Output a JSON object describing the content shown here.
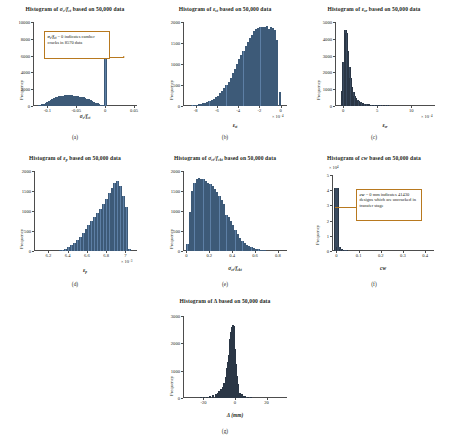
{
  "figure": {
    "panels": [
      {
        "key": "a",
        "caption": "(a)",
        "title": "Histogram of σc/fct based on 50,000 data",
        "title_html": "Histogram of <span class=\"bd it\">σ<sub>c</sub>/f<sub>ct</sub></span> based on 50,000 data",
        "ylabel": "Frequency",
        "xlabel_html": "<span class=\"bd it\">σ<sub>c</sub>/f<sub>ct</sub></span>",
        "exponent": "",
        "annotation_html": "<span class=\"em\">σ<sub>c</sub>/f<sub>ct</sub></span> = 0 indicates camber cracks in 8570 data",
        "annotation_text": "σc/fct = 0 indicates camber cracks in 8570 data"
      },
      {
        "key": "b",
        "caption": "(b)",
        "title": "Histogram of εst based on 50,000 data",
        "title_html": "Histogram of <span class=\"bd it\">ε<sub>st</sub></span> based on 50,000 data",
        "ylabel": "Frequency",
        "xlabel_html": "<span class=\"bd it\">ε<sub>st</sub></span>",
        "exponent": "× 10⁻⁴"
      },
      {
        "key": "c",
        "caption": "(c)",
        "title": "Histogram of εsr based on 50,000 data",
        "title_html": "Histogram of <span class=\"bd it\">ε<sub>sr</sub></span> based on 50,000 data",
        "ylabel": "Frequency",
        "xlabel_html": "<span class=\"bd it\">ε<sub>sr</sub></span>",
        "exponent": "× 10⁻⁴"
      },
      {
        "key": "d",
        "caption": "(d)",
        "title": "Histogram of εp based on 50,000 data",
        "title_html": "Histogram of <span class=\"bd it\">ε<sub>p</sub></span> based on 50,000 data",
        "ylabel": "Frequency",
        "xlabel_html": "<span class=\"bd it\">ε<sub>p</sub></span>",
        "exponent": "× 10⁻³"
      },
      {
        "key": "e",
        "caption": "(e)",
        "title": "Histogram of σct/fckt based on 50,000 data",
        "title_html": "Histogram of <span class=\"bd it\">σ<sub>ct</sub>/f<sub>ckt</sub></span> based on 50,000 data",
        "ylabel": "Frequency",
        "xlabel_html": "<span class=\"bd it\">σ<sub>ct</sub>/f<sub>ckt</sub></span>",
        "exponent": ""
      },
      {
        "key": "f",
        "caption": "(f)",
        "title": "Histogram of cw based on 50,000 data",
        "title_html": "Histogram of <span class=\"bd it\">cw</span> based on 50,000 data",
        "ylabel": "Frequency",
        "xlabel_html": "<span class=\"bd it\">cw</span>",
        "exponent": "× 10⁴",
        "annotation_html": "<span class=\"em\">cw</span> = 0 mm indicates 41430 designs which are uncracked in transfer stage",
        "annotation_text": "cw = 0 mm indicates 41430 designs which are uncracked in transfer stage"
      },
      {
        "key": "g",
        "caption": "(g)",
        "title": "Histogram of Δ based on 50,000 data",
        "title_html": "Histogram of <span class=\"bd\">Δ</span> based on 50,000 data",
        "ylabel": "Frequency",
        "xlabel_html": "<span class=\"bd it\">Δ</span> (mm)",
        "exponent": ""
      }
    ]
  },
  "chart_data": [
    {
      "id": "a",
      "type": "bar",
      "title": "Histogram of σc/fct based on 50,000 data",
      "xlabel": "σc/fct",
      "ylabel": "Frequency",
      "xlim": [
        -0.125,
        0.055
      ],
      "ylim": [
        0,
        10000
      ],
      "xticks": [
        -0.1,
        -0.05,
        0,
        0.05
      ],
      "xticklabels": [
        "-0.1",
        "-0.05",
        "0",
        "0.05"
      ],
      "yticks": [
        0,
        2000,
        4000,
        6000,
        8000,
        10000
      ],
      "yticklabels": [
        "0",
        "2000",
        "4000",
        "6000",
        "8000",
        "10000"
      ],
      "grid": false,
      "annotation": "σc/fct = 0 indicates camber cracks in 8570 data",
      "bin_centers": [
        -0.1185,
        -0.1155,
        -0.1125,
        -0.1095,
        -0.1065,
        -0.1035,
        -0.1005,
        -0.0975,
        -0.0945,
        -0.0915,
        -0.0885,
        -0.0855,
        -0.0825,
        -0.0795,
        -0.0765,
        -0.0735,
        -0.0705,
        -0.0675,
        -0.0645,
        -0.0615,
        -0.0585,
        -0.0555,
        -0.0525,
        -0.0495,
        -0.0465,
        -0.0435,
        -0.0405,
        -0.0375,
        -0.0345,
        -0.0315,
        -0.0285,
        -0.0255,
        -0.0225,
        -0.0195,
        -0.0165,
        -0.0135,
        -0.0105,
        -0.0075,
        -0.0045,
        -0.0015
      ],
      "values": [
        40,
        70,
        120,
        190,
        280,
        380,
        500,
        620,
        740,
        850,
        950,
        1040,
        1110,
        1170,
        1210,
        1240,
        1260,
        1270,
        1275,
        1270,
        1260,
        1245,
        1225,
        1200,
        1170,
        1130,
        1080,
        1020,
        950,
        870,
        780,
        690,
        590,
        490,
        390,
        300,
        220,
        150,
        95,
        55
      ],
      "spike": {
        "x": 0,
        "value": 8570,
        "label": "camber cracks"
      }
    },
    {
      "id": "b",
      "type": "bar",
      "title": "Histogram of εst based on 50,000 data",
      "xlabel": "εst",
      "ylabel": "Frequency",
      "x_scale": "× 10⁻⁴",
      "xlim": [
        -9.2,
        0.6
      ],
      "ylim": [
        0,
        2000
      ],
      "xticks": [
        -8,
        -6,
        -4,
        -2,
        0
      ],
      "xticklabels": [
        "-8",
        "-6",
        "-4",
        "-2",
        "0"
      ],
      "yticks": [
        0,
        500,
        1000,
        1500,
        2000
      ],
      "yticklabels": [
        "0",
        "500",
        "1000",
        "1500",
        "2000"
      ],
      "grid": false,
      "bin_centers": [
        -8.9,
        -8.7,
        -8.5,
        -8.3,
        -8.1,
        -7.9,
        -7.7,
        -7.5,
        -7.3,
        -7.1,
        -6.9,
        -6.7,
        -6.5,
        -6.3,
        -6.1,
        -5.9,
        -5.7,
        -5.5,
        -5.3,
        -5.1,
        -4.9,
        -4.7,
        -4.5,
        -4.3,
        -4.1,
        -3.9,
        -3.7,
        -3.5,
        -3.3,
        -3.1,
        -2.9,
        -2.7,
        -2.5,
        -2.3,
        -2.1,
        -1.9,
        -1.7,
        -1.5,
        -1.3,
        -1.1,
        -0.9,
        -0.7,
        -0.5,
        -0.3,
        -0.1
      ],
      "values": [
        5,
        8,
        12,
        18,
        25,
        33,
        42,
        52,
        65,
        80,
        98,
        120,
        145,
        175,
        210,
        250,
        300,
        355,
        420,
        495,
        580,
        675,
        780,
        890,
        1000,
        1110,
        1220,
        1320,
        1420,
        1520,
        1620,
        1700,
        1780,
        1830,
        1860,
        1880,
        1890,
        1870,
        1900,
        1840,
        1880,
        1850,
        1800,
        1560,
        340
      ]
    },
    {
      "id": "c",
      "type": "bar",
      "title": "Histogram of εsr based on 50,000 data",
      "xlabel": "εsr",
      "ylabel": "Frequency",
      "x_scale": "× 10⁻⁴",
      "xlim": [
        -1.2,
        13.5
      ],
      "ylim": [
        0,
        5000
      ],
      "xticks": [
        0,
        5,
        10
      ],
      "xticklabels": [
        "0",
        "5",
        "10"
      ],
      "yticks": [
        0,
        1000,
        2000,
        3000,
        4000,
        5000
      ],
      "yticklabels": [
        "0",
        "1000",
        "2000",
        "3000",
        "4000",
        "5000"
      ],
      "grid": false,
      "bin_centers": [
        -0.1,
        0.1,
        0.3,
        0.5,
        0.7,
        0.9,
        1.1,
        1.3,
        1.5,
        1.7,
        1.9,
        2.1,
        2.3,
        2.5,
        2.7,
        2.9,
        3.1,
        3.4,
        3.8,
        4.2,
        4.6,
        5.0,
        5.5,
        6.0,
        6.5,
        7.0,
        7.5,
        8.0,
        8.5,
        9.0,
        9.5,
        10.0,
        10.5,
        11.0,
        11.5,
        12.0
      ],
      "values": [
        900,
        2600,
        4550,
        4350,
        3300,
        2350,
        1650,
        1150,
        820,
        600,
        450,
        350,
        280,
        225,
        185,
        155,
        130,
        110,
        92,
        78,
        66,
        56,
        48,
        41,
        35,
        30,
        26,
        22,
        19,
        16,
        14,
        12,
        10,
        8,
        7,
        5
      ]
    },
    {
      "id": "d",
      "type": "bar",
      "title": "Histogram of εp based on 50,000 data",
      "xlabel": "εp",
      "ylabel": "Frequency",
      "x_scale": "× 10⁻³",
      "xlim": [
        6.05,
        7.12
      ],
      "ylim": [
        0,
        2000
      ],
      "xticks": [
        6.2,
        6.4,
        6.6,
        6.8,
        7.0
      ],
      "xticklabels": [
        "6.2",
        "6.4",
        "6.6",
        "6.8",
        "7"
      ],
      "yticks": [
        0,
        500,
        1000,
        1500,
        2000
      ],
      "yticklabels": [
        "0",
        "500",
        "1000",
        "1500",
        "2000"
      ],
      "grid": false,
      "bin_centers": [
        6.32,
        6.35,
        6.38,
        6.41,
        6.44,
        6.47,
        6.5,
        6.53,
        6.56,
        6.59,
        6.62,
        6.65,
        6.68,
        6.71,
        6.74,
        6.77,
        6.8,
        6.83,
        6.86,
        6.89,
        6.92,
        6.95,
        6.98,
        7.01,
        7.04
      ],
      "values": [
        15,
        30,
        55,
        90,
        140,
        200,
        280,
        360,
        450,
        545,
        640,
        740,
        840,
        940,
        1050,
        1170,
        1300,
        1440,
        1580,
        1700,
        1760,
        1620,
        1380,
        1100,
        60
      ]
    },
    {
      "id": "e",
      "type": "bar",
      "title": "Histogram of σct/fckt based on 50,000 data",
      "xlabel": "σct/fckt",
      "ylabel": "Frequency",
      "xlim": [
        -0.03,
        0.88
      ],
      "ylim": [
        0,
        2000
      ],
      "xticks": [
        0,
        0.2,
        0.4,
        0.6,
        0.8
      ],
      "xticklabels": [
        "0",
        "0.2",
        "0.4",
        "0.6",
        "0.8"
      ],
      "yticks": [
        0,
        500,
        1000,
        1500,
        2000
      ],
      "yticklabels": [
        "0",
        "500",
        "1000",
        "1500",
        "2000"
      ],
      "grid": false,
      "bin_centers": [
        0.01,
        0.03,
        0.05,
        0.07,
        0.09,
        0.11,
        0.13,
        0.15,
        0.17,
        0.19,
        0.21,
        0.23,
        0.25,
        0.27,
        0.29,
        0.31,
        0.33,
        0.35,
        0.37,
        0.39,
        0.41,
        0.43,
        0.45,
        0.47,
        0.49,
        0.51,
        0.53,
        0.55,
        0.57,
        0.59,
        0.61,
        0.63,
        0.65,
        0.67,
        0.69,
        0.71,
        0.73
      ],
      "values": [
        180,
        980,
        1500,
        1700,
        1790,
        1830,
        1800,
        1790,
        1760,
        1700,
        1680,
        1620,
        1560,
        1480,
        1380,
        1280,
        1180,
        900,
        860,
        760,
        640,
        520,
        420,
        330,
        255,
        195,
        150,
        115,
        88,
        66,
        50,
        38,
        28,
        20,
        14,
        9,
        5
      ]
    },
    {
      "id": "f",
      "type": "bar",
      "title": "Histogram of cw based on 50,000 data",
      "xlabel": "cw",
      "ylabel": "Frequency",
      "y_scale": "× 10⁴",
      "xlim": [
        -0.02,
        0.44
      ],
      "ylim": [
        0,
        5
      ],
      "xticks": [
        0,
        0.1,
        0.2,
        0.3,
        0.4
      ],
      "xticklabels": [
        "0",
        "0.1",
        "0.2",
        "0.3",
        "0.4"
      ],
      "yticks": [
        0,
        1,
        2,
        3,
        4,
        5
      ],
      "yticklabels": [
        "0",
        "1",
        "2",
        "3",
        "4",
        "5"
      ],
      "grid": false,
      "annotation": "cw = 0 mm indicates 41430 designs which are uncracked in transfer stage",
      "bin_centers": [
        0.0,
        0.01,
        0.02,
        0.03,
        0.04,
        0.05,
        0.06,
        0.08,
        0.1,
        0.12,
        0.15,
        0.2,
        0.25,
        0.3,
        0.35,
        0.4
      ],
      "values": [
        4.143,
        0.28,
        0.12,
        0.07,
        0.045,
        0.03,
        0.022,
        0.015,
        0.01,
        0.007,
        0.005,
        0.003,
        0.002,
        0.001,
        0.0008,
        0.0005
      ]
    },
    {
      "id": "g",
      "type": "bar",
      "title": "Histogram of Δ based on 50,000 data",
      "xlabel": "Δ (mm)",
      "ylabel": "Frequency",
      "xlim": [
        -33,
        33
      ],
      "ylim": [
        0,
        3000
      ],
      "xticks": [
        -20,
        0,
        20
      ],
      "xticklabels": [
        "-20",
        "0",
        "20"
      ],
      "yticks": [
        0,
        1000,
        2000,
        3000
      ],
      "yticklabels": [
        "0",
        "1000",
        "2000",
        "3000"
      ],
      "grid": false,
      "bin_centers": [
        -26,
        -24,
        -22,
        -20,
        -18,
        -16,
        -14,
        -12,
        -11,
        -10,
        -9,
        -8,
        -7,
        -6,
        -5.5,
        -5,
        -4.5,
        -4,
        -3.5,
        -3,
        -2.5,
        -2,
        -1.5,
        -1,
        -0.5,
        0,
        0.5,
        1,
        1.5,
        2,
        3,
        4,
        5,
        6,
        8,
        10,
        12,
        14
      ],
      "values": [
        10,
        15,
        22,
        32,
        48,
        70,
        100,
        150,
        195,
        250,
        320,
        420,
        560,
        760,
        900,
        1080,
        1300,
        1560,
        1850,
        2150,
        2420,
        2600,
        2680,
        2620,
        2300,
        1800,
        1250,
        800,
        520,
        360,
        200,
        130,
        90,
        60,
        35,
        20,
        12,
        7
      ]
    }
  ]
}
